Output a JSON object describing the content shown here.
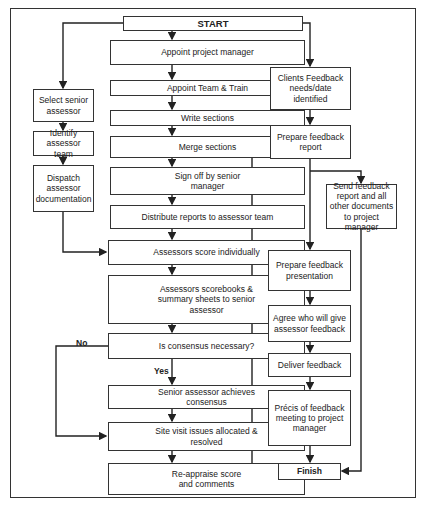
{
  "diagram": {
    "type": "flowchart",
    "nodes": {
      "start": "START",
      "appoint_pm": "Appoint project manager",
      "appoint_team": "Appoint Team & Train",
      "write_sections": "Write sections",
      "merge_sections": "Merge sections",
      "sign_off": "Sign off by senior manager",
      "distribute": "Distribute reports to assessor team",
      "score_individually": "Assessors score individually",
      "scorebooks": "Assessors scorebooks & summary sheets to senior assessor",
      "consensus_q": "Is consensus necessary?",
      "achieve_consensus": "Senior assessor achieves consensus",
      "site_visit": "Site visit issues allocated & resolved",
      "reappraise": "Re-appraise score and comments",
      "select_senior": "Select senior assessor",
      "identify_team": "Identify assessor team",
      "dispatch_docs": "Dispatch assessor documentation",
      "clients_feedback": "Clients Feedback needs/date identified",
      "prepare_report": "Prepare feedback report",
      "send_feedback": "Send feedback report and all other documents to project manager",
      "prepare_presentation": "Prepare feedback presentation",
      "agree_who": "Agree who will give assessor feedback",
      "deliver_feedback": "Deliver feedback",
      "precis": "Précis of feedback meeting to project manager",
      "finish": "Finish"
    },
    "edge_labels": {
      "no": "No",
      "yes": "Yes"
    },
    "edges": [
      [
        "start",
        "appoint_pm"
      ],
      [
        "start",
        "select_senior"
      ],
      [
        "start",
        "clients_feedback"
      ],
      [
        "appoint_pm",
        "appoint_team"
      ],
      [
        "appoint_team",
        "write_sections"
      ],
      [
        "write_sections",
        "merge_sections"
      ],
      [
        "merge_sections",
        "sign_off"
      ],
      [
        "sign_off",
        "distribute"
      ],
      [
        "distribute",
        "score_individually"
      ],
      [
        "select_senior",
        "identify_team"
      ],
      [
        "identify_team",
        "dispatch_docs"
      ],
      [
        "dispatch_docs",
        "score_individually"
      ],
      [
        "score_individually",
        "scorebooks"
      ],
      [
        "scorebooks",
        "consensus_q"
      ],
      [
        "consensus_q",
        "achieve_consensus",
        "Yes"
      ],
      [
        "consensus_q",
        "site_visit",
        "No"
      ],
      [
        "achieve_consensus",
        "site_visit"
      ],
      [
        "site_visit",
        "reappraise"
      ],
      [
        "reappraise",
        "prepare_report"
      ],
      [
        "clients_feedback",
        "prepare_report"
      ],
      [
        "prepare_report",
        "send_feedback"
      ],
      [
        "prepare_report",
        "prepare_presentation"
      ],
      [
        "prepare_presentation",
        "agree_who"
      ],
      [
        "agree_who",
        "deliver_feedback"
      ],
      [
        "deliver_feedback",
        "precis"
      ],
      [
        "precis",
        "finish"
      ],
      [
        "send_feedback",
        "finish"
      ]
    ]
  }
}
